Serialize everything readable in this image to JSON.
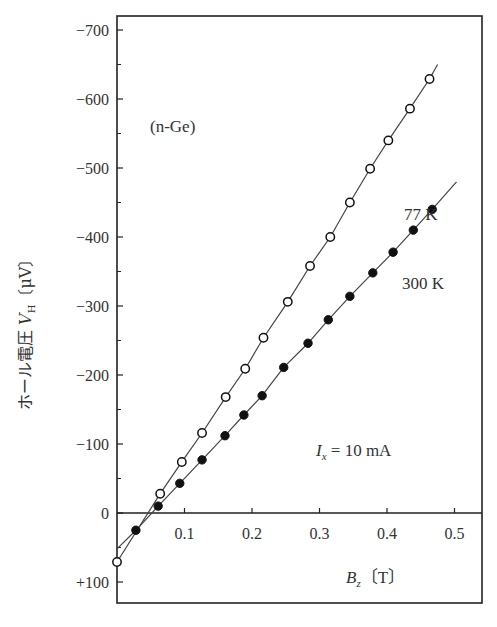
{
  "chart_data": {
    "type": "line",
    "title": "",
    "xlabel": "B_z [T]",
    "ylabel": "ホール電圧 V_H [μV]",
    "xlim": [
      0,
      0.54
    ],
    "ylim": [
      130,
      -720
    ],
    "y_axis_inverted": true,
    "x_ticks": [
      0.1,
      0.2,
      0.3,
      0.4,
      0.5
    ],
    "x_tick_labels": [
      "0.1",
      "0.2",
      "0.3",
      "0.4",
      "0.5"
    ],
    "y_ticks": [
      -700,
      -600,
      -500,
      -400,
      -300,
      -200,
      -100,
      0,
      100
    ],
    "y_tick_labels": [
      "−700",
      "−600",
      "−500",
      "−400",
      "−300",
      "−200",
      "−100",
      "0",
      "+100"
    ],
    "grid": false,
    "annotations": [
      "(n-Ge)",
      "77 K",
      "300 K",
      "I_x = 10 mA"
    ],
    "series": [
      {
        "name": "77 K",
        "marker": "open-circle",
        "x": [
          0.0,
          0.064,
          0.096,
          0.126,
          0.161,
          0.19,
          0.217,
          0.253,
          0.286,
          0.316,
          0.345,
          0.375,
          0.402,
          0.434,
          0.463
        ],
        "y": [
          71,
          -28,
          -74,
          -116,
          -168,
          -209,
          -254,
          -306,
          -358,
          -400,
          -450,
          -499,
          -540,
          -586,
          -629
        ],
        "line_start": [
          0.0,
          71
        ],
        "line_end": [
          0.475,
          -650
        ]
      },
      {
        "name": "300 K",
        "marker": "filled-circle",
        "x": [
          0.028,
          0.061,
          0.093,
          0.126,
          0.16,
          0.188,
          0.215,
          0.247,
          0.283,
          0.313,
          0.345,
          0.379,
          0.409,
          0.439,
          0.467
        ],
        "y": [
          25,
          -10,
          -43,
          -77,
          -112,
          -142,
          -170,
          -211,
          -246,
          -280,
          -314,
          -348,
          -378,
          -410,
          -440
        ],
        "line_start": [
          0.0,
          52
        ],
        "line_end": [
          0.503,
          -480
        ]
      }
    ]
  },
  "labels": {
    "material": "(n-Ge)",
    "series_77": "77 K",
    "series_300": "300 K",
    "current_var": "I",
    "current_sub": "x",
    "current_rest": " = 10 mA",
    "xaxis_var": "B",
    "xaxis_sub": "z",
    "xaxis_unit": "〔T〕",
    "yaxis_jp": "ホール電圧 ",
    "yaxis_var": "V",
    "yaxis_sub": "H",
    "yaxis_unit": "〔μV〕"
  },
  "colors": {
    "axis": "#222222",
    "line": "#444444",
    "marker": "#111111",
    "background": "#ffffff"
  }
}
